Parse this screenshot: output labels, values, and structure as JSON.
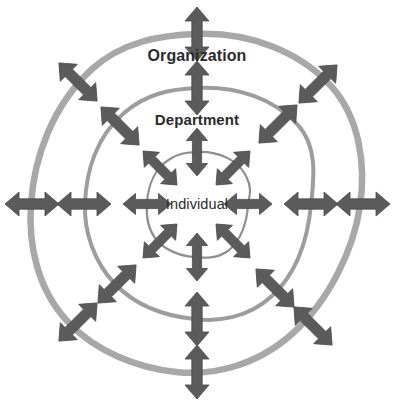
{
  "diagram": {
    "type": "concentric-rings-bidirectional-arrows",
    "title": "",
    "background_color": "#ffffff",
    "center": {
      "x": 197,
      "y": 203
    },
    "colors": {
      "arrow_fill": "#5b5b5b",
      "arrow_stroke": "#4a4a4a",
      "outer_ring_stroke": "#a8a8a8",
      "middle_ring_stroke": "#9d9d9d",
      "inner_ring_stroke": "#8f8f8f",
      "label_text": "#2b2b2b"
    },
    "rings": [
      {
        "id": "organization",
        "label": "Organization",
        "level": 3,
        "radius_x": 166,
        "radius_y": 169,
        "stroke_width": 6.5,
        "stroke_color": "#a8a8a8",
        "label_x": 197,
        "label_y": 56,
        "arrow_count": 8
      },
      {
        "id": "department",
        "label": "Department",
        "level": 2,
        "radius_x": 114,
        "radius_y": 115,
        "stroke_width": 4,
        "stroke_color": "#9d9d9d",
        "label_x": 197,
        "label_y": 119,
        "arrow_count": 8
      },
      {
        "id": "individual",
        "label": "Individual",
        "level": 1,
        "radius_x": 51,
        "radius_y": 52,
        "stroke_width": 2.2,
        "stroke_color": "#8f8f8f",
        "label_x": 197,
        "label_y": 204,
        "arrow_count": 8
      }
    ],
    "arrow_angles_degrees": [
      0,
      45,
      90,
      135,
      180,
      225,
      270,
      315
    ],
    "arrow_style": {
      "heads": 2,
      "description": "double-headed arrow crossing each ring radially"
    },
    "total_arrows": 24
  }
}
